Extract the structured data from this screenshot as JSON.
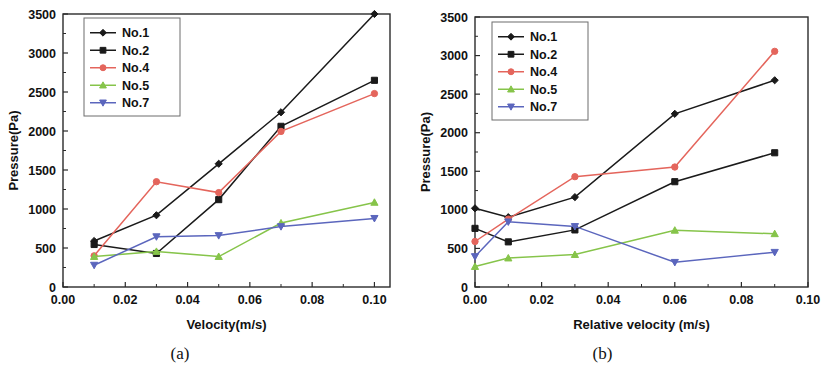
{
  "figure": {
    "panels": [
      {
        "caption": "(a)",
        "xlabel": "Velocity(m/s)",
        "ylabel": "Pressure(Pa)"
      },
      {
        "caption": "(b)",
        "xlabel": "Relative velocity (m/s)",
        "ylabel": "Pressure(Pa)"
      }
    ]
  },
  "colors": {
    "no1": "#1a1a1a",
    "no2": "#1a1a1a",
    "no4": "#e4655c",
    "no5": "#86c councils",
    "no5_fixed": "#86c44a",
    "no7": "#5b66bd",
    "frame": "#2b2b2b",
    "legend_border": "#6d6d6d"
  },
  "chart_data": [
    {
      "type": "line",
      "title": "(a)",
      "xlabel": "Velocity(m/s)",
      "ylabel": "Pressure(Pa)",
      "xlim": [
        0.0,
        0.105
      ],
      "ylim": [
        0,
        3500
      ],
      "xticks": [
        0.0,
        0.02,
        0.04,
        0.06,
        0.08,
        0.1
      ],
      "xtick_labels": [
        "0.00",
        "0.02",
        "0.04",
        "0.06",
        "0.08",
        "0.10"
      ],
      "yticks": [
        0,
        500,
        1000,
        1500,
        2000,
        2500,
        3000,
        3500
      ],
      "ytick_labels": [
        "0",
        "500",
        "1000",
        "1500",
        "2000",
        "2500",
        "3000",
        "3500"
      ],
      "grid": false,
      "legend_position": "upper left",
      "x": [
        0.01,
        0.03,
        0.05,
        0.07,
        0.1
      ],
      "series": [
        {
          "name": "No.1",
          "marker": "diamond",
          "color": "#1a1a1a",
          "values": [
            590,
            920,
            1580,
            2240,
            3500
          ]
        },
        {
          "name": "No.2",
          "marker": "square",
          "color": "#1a1a1a",
          "values": [
            545,
            430,
            1120,
            2060,
            2650
          ]
        },
        {
          "name": "No.4",
          "marker": "circle",
          "color": "#e4655c",
          "values": [
            400,
            1350,
            1210,
            1995,
            2480
          ]
        },
        {
          "name": "No.5",
          "marker": "triangle-up",
          "color": "#86c44a",
          "values": [
            390,
            455,
            390,
            820,
            1085
          ]
        },
        {
          "name": "No.7",
          "marker": "triangle-down",
          "color": "#5b66bd",
          "values": [
            280,
            645,
            660,
            775,
            880
          ]
        }
      ]
    },
    {
      "type": "line",
      "title": "(b)",
      "xlabel": "Relative velocity (m/s)",
      "ylabel": "Pressure(Pa)",
      "xlim": [
        0.0,
        0.1
      ],
      "ylim": [
        0,
        3500
      ],
      "xticks": [
        0.0,
        0.02,
        0.04,
        0.06,
        0.08,
        0.1
      ],
      "xtick_labels": [
        "0.00",
        "0.02",
        "0.04",
        "0.06",
        "0.08",
        "0.10"
      ],
      "yticks": [
        0,
        500,
        1000,
        1500,
        2000,
        2500,
        3000,
        3500
      ],
      "ytick_labels": [
        "0",
        "500",
        "1000",
        "1500",
        "2000",
        "2500",
        "3000",
        "3500"
      ],
      "grid": false,
      "legend_position": "upper left",
      "x": [
        0.0,
        0.01,
        0.03,
        0.06,
        0.09
      ],
      "series": [
        {
          "name": "No.1",
          "marker": "diamond",
          "color": "#1a1a1a",
          "values": [
            1020,
            905,
            1165,
            2245,
            2680
          ]
        },
        {
          "name": "No.2",
          "marker": "square",
          "color": "#1a1a1a",
          "values": [
            760,
            585,
            740,
            1365,
            1740
          ]
        },
        {
          "name": "No.4",
          "marker": "circle",
          "color": "#e4655c",
          "values": [
            590,
            880,
            1430,
            1555,
            3055
          ]
        },
        {
          "name": "No.5",
          "marker": "triangle-up",
          "color": "#86c44a",
          "values": [
            265,
            375,
            420,
            735,
            690
          ]
        },
        {
          "name": "No.7",
          "marker": "triangle-down",
          "color": "#5b66bd",
          "values": [
            395,
            845,
            785,
            320,
            450
          ]
        }
      ]
    }
  ],
  "legend": {
    "items": [
      {
        "label": "No.1"
      },
      {
        "label": "No.2"
      },
      {
        "label": "No.4"
      },
      {
        "label": "No.5"
      },
      {
        "label": "No.7"
      }
    ]
  }
}
